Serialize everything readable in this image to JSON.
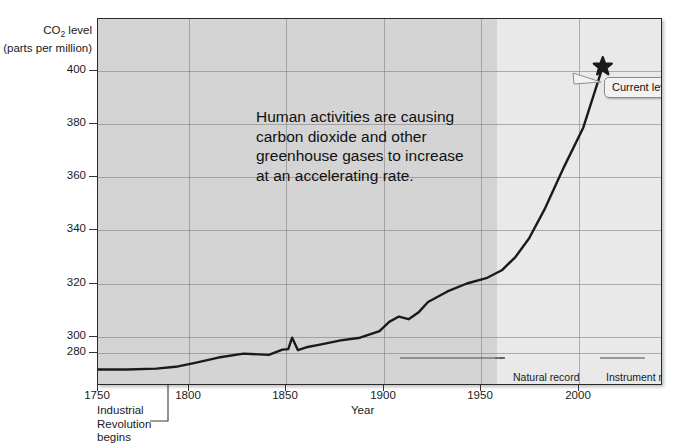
{
  "figure": {
    "y_axis_title_line1": "CO",
    "y_axis_title_sub": "2",
    "y_axis_title_line1b": " level",
    "y_axis_title_line2": "(parts per million)",
    "x_axis_title": "Year",
    "annotation": "Human activities are causing carbon dioxide and other greenhouse gases to increase at an accelerating rate.",
    "current_level_label": "Current level",
    "natural_record_label": "Natural record",
    "instrument_record_label": "Instrument record",
    "industrial_note_line1": "Industrial",
    "industrial_note_line2": "Revolution",
    "industrial_note_line3": "begins",
    "colors": {
      "plot_background": "#d4d4d4",
      "instrument_band": "#e9e9e9",
      "line": "#1a1a1a",
      "gridline": "#787878",
      "frame": "#2a2a2a",
      "bubble_fill": "#f2f2f2"
    }
  },
  "chart_data": {
    "type": "line",
    "title": "",
    "xlabel": "Year",
    "ylabel": "CO2 level (parts per million)",
    "xlim": [
      1750,
      2040
    ],
    "ylim": [
      272,
      410
    ],
    "grid": true,
    "legend": "none",
    "xticks": [
      1750,
      1800,
      1850,
      1900,
      1950,
      2000
    ],
    "yticks": [
      280,
      300,
      320,
      340,
      360,
      380,
      400
    ],
    "series": [
      {
        "name": "Atmospheric CO2",
        "x": [
          1750,
          1765,
          1780,
          1790,
          1800,
          1812,
          1825,
          1838,
          1845,
          1848,
          1850,
          1853,
          1858,
          1865,
          1875,
          1885,
          1895,
          1900,
          1905,
          1910,
          1915,
          1920,
          1930,
          1940,
          1950,
          1958,
          1965,
          1972,
          1980,
          1990,
          2000,
          2010
        ],
        "y": [
          277.5,
          277.5,
          277.8,
          278.5,
          280.0,
          282.0,
          283.5,
          283.0,
          285.0,
          285.2,
          289.5,
          284.8,
          286.0,
          287.0,
          288.5,
          289.5,
          292.0,
          295.5,
          297.5,
          296.5,
          299.0,
          303.0,
          307.0,
          310.0,
          312.0,
          315.0,
          320.0,
          327.0,
          338.0,
          354.0,
          369.0,
          392.0
        ]
      }
    ],
    "markers": [
      {
        "name": "current-level",
        "shape": "star",
        "x": 2010,
        "y": 392,
        "label": "Current level"
      }
    ],
    "regions": [
      {
        "name": "natural-record",
        "x_start": 1750,
        "x_end": 1958,
        "shade": "#d4d4d4",
        "label": "Natural record"
      },
      {
        "name": "instrument-record",
        "x_start": 1958,
        "x_end": 2040,
        "shade": "#e9e9e9",
        "label": "Instrument record"
      }
    ],
    "annotations": [
      {
        "name": "human-activities-note",
        "text": "Human activities are causing carbon dioxide and other greenhouse gases to increase at an accelerating rate."
      },
      {
        "name": "industrial-revolution",
        "text": "Industrial Revolution begins",
        "x": 1770
      }
    ]
  }
}
